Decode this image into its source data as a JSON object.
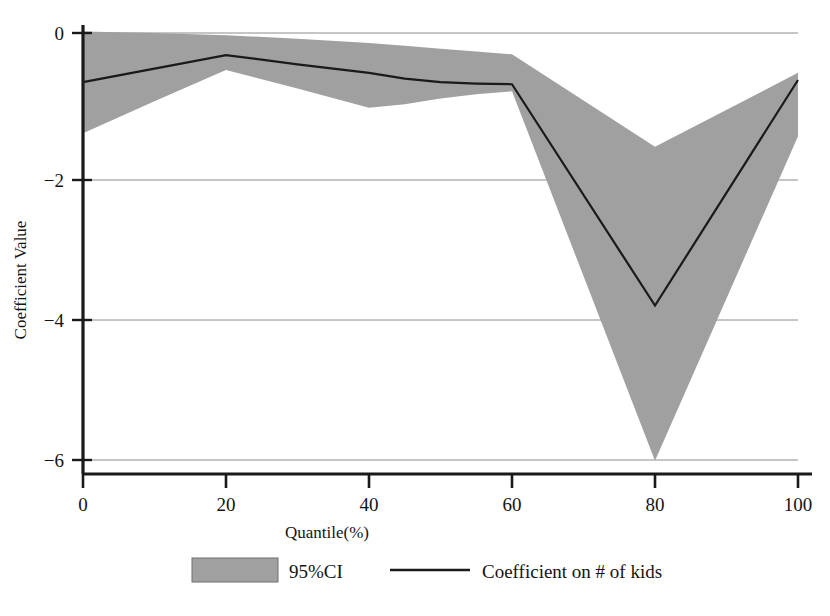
{
  "chart_data": {
    "type": "line",
    "title": "",
    "subtitle": "",
    "xlabel": "Quantile(%)",
    "ylabel": "Coefficient Value",
    "xlim": [
      0,
      100
    ],
    "ylim": [
      -6.2,
      0.15
    ],
    "xticks": [
      0,
      20,
      40,
      60,
      80,
      100
    ],
    "xtick_labels": [
      "0",
      "20",
      "40",
      "60",
      "80",
      "100"
    ],
    "yticks": [
      0,
      -2,
      -4,
      -6
    ],
    "ytick_labels": [
      "0",
      "−2",
      "−4",
      "−6"
    ],
    "grid": "horizontal",
    "legend_position": "bottom",
    "x": [
      0,
      10,
      20,
      30,
      40,
      45,
      50,
      55,
      60,
      80,
      100
    ],
    "series": [
      {
        "name": "Coefficient on # of kids",
        "type": "line",
        "color": "#1a1a1a",
        "values": [
          -0.69,
          -0.5,
          -0.31,
          -0.44,
          -0.56,
          -0.64,
          -0.69,
          -0.71,
          -0.72,
          -3.83,
          -0.66
        ]
      },
      {
        "name": "95%CI upper",
        "type": "band-upper",
        "values": [
          0.02,
          0.0,
          -0.03,
          -0.08,
          -0.14,
          -0.18,
          -0.22,
          -0.26,
          -0.3,
          -1.6,
          -0.56
        ]
      },
      {
        "name": "95%CI lower",
        "type": "band-lower",
        "values": [
          -1.41,
          -0.96,
          -0.52,
          -0.78,
          -1.05,
          -1.0,
          -0.92,
          -0.86,
          -0.82,
          -6.01,
          -1.45
        ]
      }
    ],
    "band": {
      "name": "95%CI",
      "fill_color": "#a0a0a0",
      "opacity": 1
    },
    "annotations": []
  },
  "legend": {
    "items": [
      {
        "key": "ci-swatch",
        "label": "95%CI",
        "marker": "filled-rect",
        "color": "#a0a0a0"
      },
      {
        "key": "line-swatch",
        "label": "Coefficient on # of kids",
        "marker": "line",
        "color": "#1a1a1a"
      }
    ]
  },
  "axes": {
    "x_title": "Quantile(%)",
    "y_title": "Coefficient Value"
  }
}
